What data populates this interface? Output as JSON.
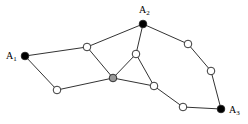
{
  "diagram": {
    "type": "graph",
    "nodes": [
      {
        "id": "A1",
        "label": "A",
        "sub": "1",
        "x": 25,
        "y": 56,
        "fill": "#000000",
        "lx": 6,
        "ly": 59
      },
      {
        "id": "A2",
        "label": "A",
        "sub": "2",
        "x": 143,
        "y": 24,
        "fill": "#000000",
        "lx": 139,
        "ly": 13
      },
      {
        "id": "A3",
        "label": "A",
        "sub": "3",
        "x": 221,
        "y": 109,
        "fill": "#000000",
        "lx": 229,
        "ly": 113
      },
      {
        "id": "n1",
        "x": 87,
        "y": 47,
        "fill": "#ffffff"
      },
      {
        "id": "g",
        "x": 113,
        "y": 78,
        "fill": "#999999"
      },
      {
        "id": "n2",
        "x": 136,
        "y": 54,
        "fill": "#ffffff"
      },
      {
        "id": "n3",
        "x": 57,
        "y": 90,
        "fill": "#ffffff"
      },
      {
        "id": "n4",
        "x": 154,
        "y": 86,
        "fill": "#ffffff"
      },
      {
        "id": "n5",
        "x": 188,
        "y": 44,
        "fill": "#ffffff"
      },
      {
        "id": "n6",
        "x": 211,
        "y": 71,
        "fill": "#ffffff"
      },
      {
        "id": "n7",
        "x": 183,
        "y": 107,
        "fill": "#ffffff"
      }
    ],
    "edges": [
      [
        "A1",
        "n1"
      ],
      [
        "n1",
        "A2"
      ],
      [
        "A1",
        "n3"
      ],
      [
        "n3",
        "g"
      ],
      [
        "n1",
        "g"
      ],
      [
        "g",
        "n2"
      ],
      [
        "n2",
        "A2"
      ],
      [
        "n2",
        "n4"
      ],
      [
        "g",
        "n4"
      ],
      [
        "n4",
        "n7"
      ],
      [
        "n7",
        "A3"
      ],
      [
        "A2",
        "n5"
      ],
      [
        "n5",
        "n6"
      ],
      [
        "n6",
        "A3"
      ]
    ]
  }
}
